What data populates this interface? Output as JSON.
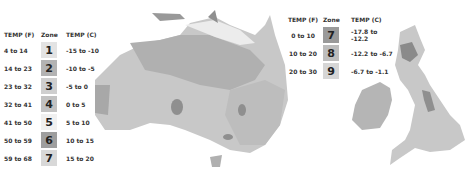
{
  "left_legend": {
    "headers": {
      "temp_f": "TEMP (F)",
      "zone": "Zone",
      "temp_c": "TEMP (C)"
    },
    "rows": [
      {
        "temp_f": "4 to 14",
        "zone": "1",
        "temp_c": "-15 to -10",
        "color": "#e3e3e3"
      },
      {
        "temp_f": "14 to 23",
        "zone": "2",
        "temp_c": "-10 to -5",
        "color": "#b3b3b3"
      },
      {
        "temp_f": "23 to 32",
        "zone": "3",
        "temp_c": "-5 to 0",
        "color": "#cfcfcf"
      },
      {
        "temp_f": "32 to 41",
        "zone": "4",
        "temp_c": "0 to 5",
        "color": "#c2c2c2"
      },
      {
        "temp_f": "41 to 50",
        "zone": "5",
        "temp_c": "5 to 10",
        "color": "#f0f0f0"
      },
      {
        "temp_f": "50 to 59",
        "zone": "6",
        "temp_c": "10 to 15",
        "color": "#9e9e9e"
      },
      {
        "temp_f": "59 to 68",
        "zone": "7",
        "temp_c": "15 to 20",
        "color": "#d8d8d8"
      }
    ]
  },
  "right_legend": {
    "headers": {
      "temp_f": "TEMP (F)",
      "zone": "Zone",
      "temp_c": "TEMP (C)"
    },
    "rows": [
      {
        "temp_f": "0 to 10",
        "zone": "7",
        "temp_c": "-17.8 to -12.2",
        "color": "#9a9a9a"
      },
      {
        "temp_f": "10 to 20",
        "zone": "8",
        "temp_c": "-12.2 to -6.7",
        "color": "#bdbdbd"
      },
      {
        "temp_f": "20 to 30",
        "zone": "9",
        "temp_c": "-6.7 to -1.1",
        "color": "#d6d6d6"
      }
    ]
  },
  "maps": {
    "australia": {
      "label": "australia-hardiness-map"
    },
    "uk": {
      "label": "uk-ireland-hardiness-map"
    }
  }
}
